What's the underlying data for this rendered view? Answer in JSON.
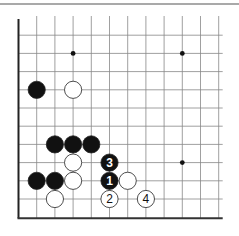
{
  "diagram": {
    "type": "go-board-fragment",
    "grid": {
      "cols": 12,
      "rows": 11,
      "x0": 18.5,
      "y0": 17,
      "step": 18.2
    },
    "edges": [
      "left",
      "bottom"
    ],
    "hoshi": [
      [
        3,
        2
      ],
      [
        9,
        2
      ],
      [
        9,
        8
      ]
    ],
    "stones": [
      {
        "col": 1,
        "row": 4,
        "color": "black",
        "label": ""
      },
      {
        "col": 3,
        "row": 4,
        "color": "white",
        "label": ""
      },
      {
        "col": 2,
        "row": 7,
        "color": "black",
        "label": ""
      },
      {
        "col": 3,
        "row": 7,
        "color": "black",
        "label": ""
      },
      {
        "col": 4,
        "row": 7,
        "color": "black",
        "label": ""
      },
      {
        "col": 3,
        "row": 8,
        "color": "white",
        "label": ""
      },
      {
        "col": 5,
        "row": 8,
        "color": "black",
        "label": "3"
      },
      {
        "col": 1,
        "row": 9,
        "color": "black",
        "label": ""
      },
      {
        "col": 2,
        "row": 9,
        "color": "black",
        "label": ""
      },
      {
        "col": 3,
        "row": 9,
        "color": "white",
        "label": ""
      },
      {
        "col": 5,
        "row": 9,
        "color": "black",
        "label": "1"
      },
      {
        "col": 6,
        "row": 9,
        "color": "white",
        "label": ""
      },
      {
        "col": 2,
        "row": 10,
        "color": "white",
        "label": ""
      },
      {
        "col": 5,
        "row": 10,
        "color": "white",
        "label": "2"
      },
      {
        "col": 7,
        "row": 10,
        "color": "white",
        "label": "4"
      }
    ]
  }
}
